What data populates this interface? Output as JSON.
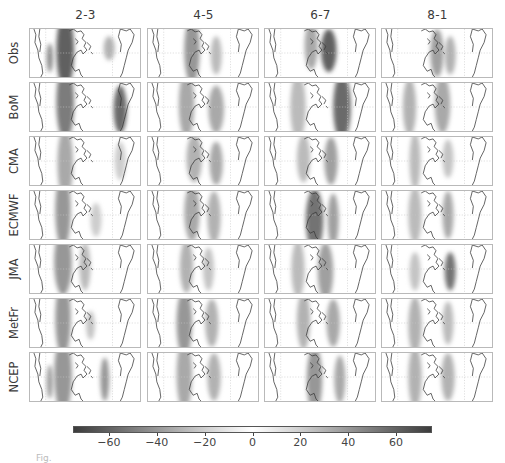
{
  "figure": {
    "caption_fragment": "Fig."
  },
  "chart_data": {
    "type": "heatmap",
    "title": "",
    "columns": [
      "2-3",
      "4-5",
      "6-7",
      "8-1"
    ],
    "rows": [
      "Obs",
      "BoM",
      "CMA",
      "ECMWF",
      "JMA",
      "MetFr",
      "NCEP"
    ],
    "colorbar": {
      "cmap": "diverging-gray (dark at extremes, white at zero)",
      "vmin": -75,
      "vmax": 75,
      "ticks": [
        -60,
        -40,
        -20,
        0,
        20,
        40,
        60
      ],
      "tick_labels": [
        "−60",
        "−40",
        "−20",
        "0",
        "20",
        "40",
        "60"
      ],
      "orientation": "horizontal",
      "position": "bottom"
    },
    "panels_blobs": {
      "Obs": [
        [
          [
            0.32,
            0.45,
            0.08,
            0.8,
            0.85
          ],
          [
            0.72,
            0.4,
            0.05,
            0.25,
            0.4
          ],
          [
            0.18,
            0.6,
            0.03,
            0.3,
            0.6
          ]
        ],
        [
          [
            0.4,
            0.45,
            0.07,
            0.7,
            0.55
          ],
          [
            0.62,
            0.55,
            0.05,
            0.4,
            0.35
          ]
        ],
        [
          [
            0.42,
            0.35,
            0.06,
            0.5,
            0.45
          ],
          [
            0.58,
            0.45,
            0.07,
            0.45,
            0.85
          ]
        ],
        [
          [
            0.5,
            0.5,
            0.06,
            0.5,
            0.5
          ],
          [
            0.62,
            0.55,
            0.05,
            0.4,
            0.4
          ]
        ]
      ],
      "BoM": [
        [
          [
            0.32,
            0.4,
            0.08,
            0.8,
            0.7
          ],
          [
            0.82,
            0.55,
            0.06,
            0.5,
            0.8
          ]
        ],
        [
          [
            0.35,
            0.45,
            0.07,
            0.7,
            0.45
          ],
          [
            0.62,
            0.55,
            0.07,
            0.5,
            0.45
          ]
        ],
        [
          [
            0.3,
            0.5,
            0.07,
            0.7,
            0.35
          ],
          [
            0.7,
            0.5,
            0.08,
            0.7,
            0.8
          ]
        ],
        [
          [
            0.25,
            0.5,
            0.06,
            0.6,
            0.4
          ],
          [
            0.55,
            0.45,
            0.07,
            0.6,
            0.45
          ]
        ]
      ],
      "CMA": [
        [
          [
            0.32,
            0.55,
            0.07,
            0.75,
            0.45
          ],
          [
            0.82,
            0.5,
            0.05,
            0.4,
            0.25
          ]
        ],
        [
          [
            0.42,
            0.45,
            0.07,
            0.5,
            0.4
          ],
          [
            0.62,
            0.55,
            0.06,
            0.45,
            0.45
          ]
        ],
        [
          [
            0.35,
            0.45,
            0.06,
            0.5,
            0.35
          ],
          [
            0.6,
            0.5,
            0.06,
            0.5,
            0.5
          ]
        ],
        [
          [
            0.3,
            0.5,
            0.05,
            0.6,
            0.35
          ],
          [
            0.6,
            0.45,
            0.05,
            0.4,
            0.3
          ]
        ]
      ],
      "ECMWF": [
        [
          [
            0.3,
            0.4,
            0.07,
            0.8,
            0.55
          ],
          [
            0.6,
            0.6,
            0.05,
            0.35,
            0.25
          ]
        ],
        [
          [
            0.4,
            0.45,
            0.07,
            0.6,
            0.45
          ],
          [
            0.6,
            0.55,
            0.06,
            0.55,
            0.4
          ]
        ],
        [
          [
            0.45,
            0.6,
            0.08,
            0.65,
            0.75
          ],
          [
            0.62,
            0.6,
            0.05,
            0.55,
            0.5
          ]
        ],
        [
          [
            0.3,
            0.5,
            0.06,
            0.6,
            0.35
          ],
          [
            0.6,
            0.5,
            0.05,
            0.5,
            0.45
          ]
        ]
      ],
      "JMA": [
        [
          [
            0.3,
            0.35,
            0.08,
            0.7,
            0.55
          ],
          [
            0.5,
            0.45,
            0.05,
            0.5,
            0.35
          ]
        ],
        [
          [
            0.35,
            0.45,
            0.06,
            0.55,
            0.4
          ],
          [
            0.55,
            0.5,
            0.05,
            0.45,
            0.3
          ]
        ],
        [
          [
            0.3,
            0.5,
            0.06,
            0.6,
            0.35
          ],
          [
            0.55,
            0.55,
            0.07,
            0.6,
            0.5
          ]
        ],
        [
          [
            0.3,
            0.55,
            0.05,
            0.4,
            0.3
          ],
          [
            0.62,
            0.55,
            0.05,
            0.4,
            0.75
          ]
        ]
      ],
      "MetFr": [
        [
          [
            0.3,
            0.4,
            0.07,
            0.8,
            0.55
          ],
          [
            0.55,
            0.55,
            0.04,
            0.3,
            0.3
          ]
        ],
        [
          [
            0.33,
            0.5,
            0.07,
            0.7,
            0.55
          ],
          [
            0.58,
            0.5,
            0.06,
            0.5,
            0.4
          ]
        ],
        [
          [
            0.35,
            0.45,
            0.06,
            0.6,
            0.4
          ],
          [
            0.62,
            0.5,
            0.06,
            0.5,
            0.45
          ]
        ],
        [
          [
            0.3,
            0.55,
            0.06,
            0.6,
            0.4
          ],
          [
            0.6,
            0.5,
            0.05,
            0.45,
            0.35
          ]
        ]
      ],
      "NCEP": [
        [
          [
            0.3,
            0.45,
            0.08,
            0.8,
            0.55
          ],
          [
            0.68,
            0.55,
            0.04,
            0.45,
            0.55
          ],
          [
            0.18,
            0.6,
            0.03,
            0.35,
            0.5
          ]
        ],
        [
          [
            0.33,
            0.45,
            0.07,
            0.75,
            0.45
          ],
          [
            0.6,
            0.5,
            0.06,
            0.5,
            0.4
          ]
        ],
        [
          [
            0.45,
            0.55,
            0.07,
            0.7,
            0.55
          ],
          [
            0.68,
            0.55,
            0.05,
            0.5,
            0.45
          ]
        ],
        [
          [
            0.3,
            0.5,
            0.06,
            0.65,
            0.4
          ],
          [
            0.6,
            0.5,
            0.06,
            0.5,
            0.4
          ]
        ]
      ]
    },
    "xlabel": "",
    "ylabel": ""
  }
}
